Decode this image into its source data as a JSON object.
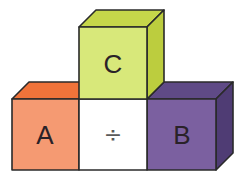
{
  "diagram": {
    "blocks": [
      {
        "id": "A",
        "label": "A",
        "position": "bottom-left",
        "color_front": "#f59a72",
        "color_top": "#f0733a"
      },
      {
        "id": "C",
        "label": "C",
        "position": "top-center",
        "color_front": "#d8e87a",
        "color_top": "#c6d64a",
        "color_side": "#bccd3e"
      },
      {
        "id": "B",
        "label": "B",
        "position": "bottom-right",
        "color_front": "#7b60a0",
        "color_top": "#5f4a86",
        "color_side": "#4f3c74"
      }
    ],
    "operator": {
      "symbol": "÷",
      "name": "division",
      "position": "bottom-center",
      "background": "#ffffff"
    },
    "outline_color": "#2a2a2a"
  }
}
